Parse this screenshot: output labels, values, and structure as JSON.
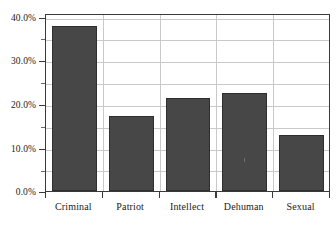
{
  "chart_data": {
    "type": "bar",
    "title": "",
    "subtitle": "",
    "xlabel": "",
    "ylabel": "",
    "categories": [
      "Criminal",
      "Patriot",
      "Intellect",
      "Dehuman",
      "Sexual"
    ],
    "values": [
      39.4,
      18.0,
      22.2,
      23.3,
      13.3
    ],
    "value_labels": [
      "39.4%",
      "18.0%",
      "22.2%",
      "23.3%",
      "13.3%"
    ],
    "ylim": [
      0,
      42
    ],
    "y_ticks": [
      0,
      10,
      20,
      30,
      40
    ],
    "y_tick_labels": [
      "0.0%",
      "10.0%",
      "20.0%",
      "30.0%",
      "40.0%"
    ],
    "y_minor_ticks": [
      5,
      15,
      25,
      35
    ],
    "grid": "both",
    "legend": "none",
    "annotations": [],
    "bar_color": "#474747",
    "bar_edge_color": "#2e2e2e",
    "grid_color": "#c9c9c9",
    "axis_color": "#3a3a3a",
    "background_color": "#ffffff"
  }
}
